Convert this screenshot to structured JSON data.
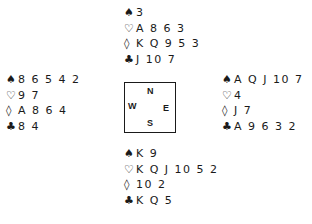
{
  "suits": {
    "spades": "♠",
    "hearts": "♡",
    "diamonds": "◊",
    "clubs": "♣"
  },
  "hands": {
    "north": {
      "spades": "3",
      "hearts": "A 8 6 3",
      "diamonds": "K Q 9 5 3",
      "clubs": "J 10 7"
    },
    "west": {
      "spades": "8 6 5 4 2",
      "hearts": "9 7",
      "diamonds": "A 8 6 4",
      "clubs": "8 4"
    },
    "east": {
      "spades": "A Q J 10 7",
      "hearts": "4",
      "diamonds": "J 7",
      "clubs": "A 9 6 3 2"
    },
    "south": {
      "spades": "K 9",
      "hearts": "K Q J 10 5 2",
      "diamonds": "10 2",
      "clubs": "K Q 5"
    }
  },
  "compass": {
    "n": "N",
    "w": "W",
    "e": "E",
    "s": "S"
  }
}
